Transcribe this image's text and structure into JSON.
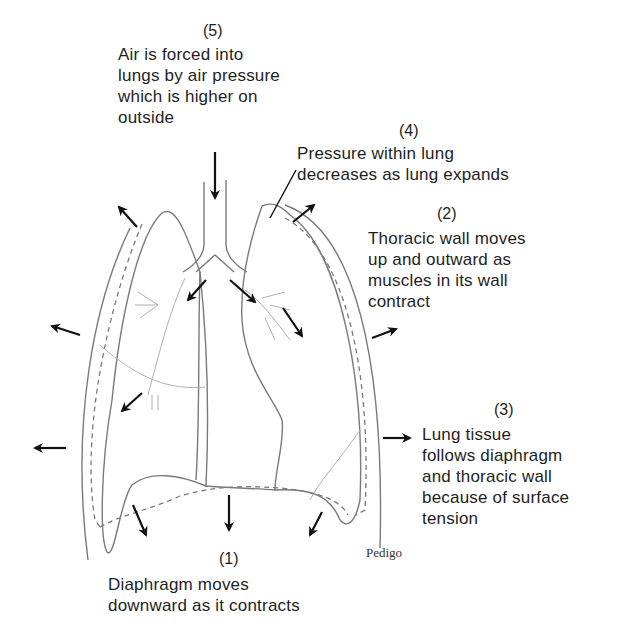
{
  "diagram": {
    "labels": [
      {
        "id": "step-5",
        "number": "(5)",
        "lines": [
          "Air is forced into",
          "lungs by air pressure",
          "which is higher on",
          "outside"
        ]
      },
      {
        "id": "step-4",
        "number": "(4)",
        "lines": [
          "Pressure within lung",
          "decreases as lung expands"
        ]
      },
      {
        "id": "step-2",
        "number": "(2)",
        "lines": [
          "Thoracic wall moves",
          "up and outward as",
          "muscles in its wall",
          "contract"
        ]
      },
      {
        "id": "step-3",
        "number": "(3)",
        "lines": [
          "Lung tissue",
          "follows diaphragm",
          "and thoracic wall",
          "because of surface",
          "tension"
        ]
      },
      {
        "id": "step-1",
        "number": "(1)",
        "lines": [
          "Diaphragm moves",
          "downward as it contracts"
        ]
      }
    ],
    "signature": "Pedigo",
    "colors": {
      "outline": "#7a7a7a",
      "arrow": "#111111",
      "text": "#1e1e1e",
      "background": "#ffffff"
    }
  }
}
